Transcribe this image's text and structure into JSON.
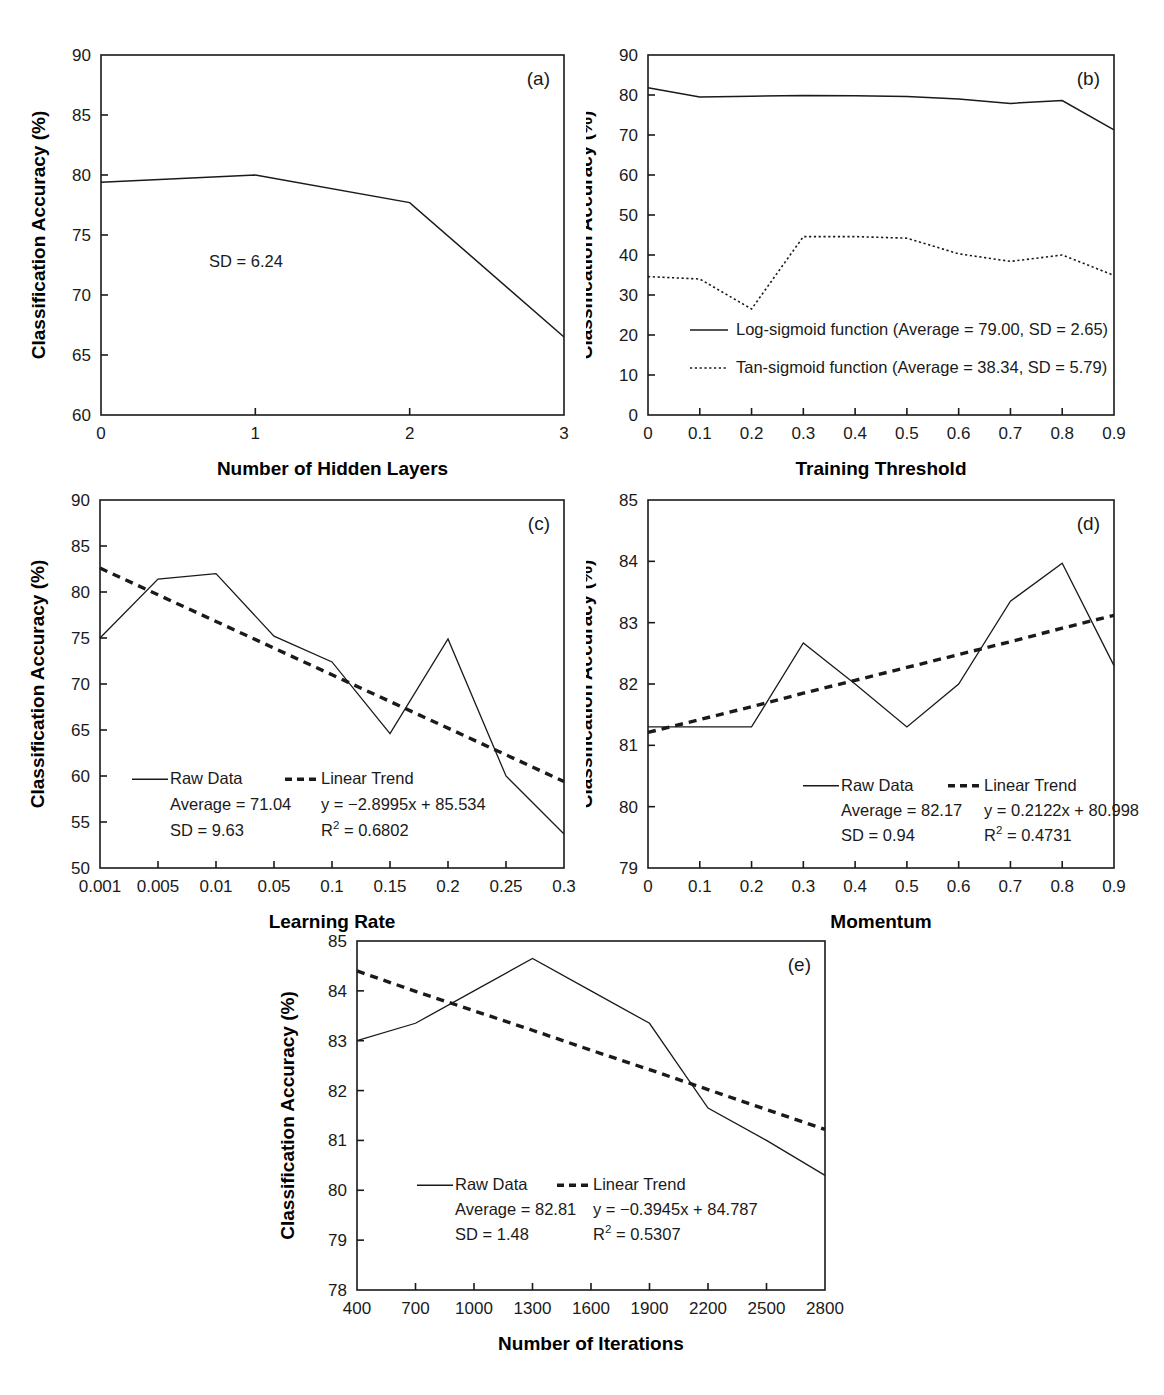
{
  "figure": {
    "y_axis_label": "Classification Accuracy (%)",
    "panel_labels": [
      "(a)",
      "(b)",
      "(c)",
      "(d)",
      "(e)"
    ]
  },
  "chart_data": [
    {
      "id": "a",
      "type": "line",
      "panel_label": "(a)",
      "title": "",
      "xlabel": "Number of Hidden Layers",
      "ylabel": "Classification Accuracy (%)",
      "xlim": [
        0,
        3
      ],
      "ylim": [
        60,
        90
      ],
      "xticks": [
        "0",
        "1",
        "2",
        "3"
      ],
      "yticks": [
        "60",
        "65",
        "70",
        "75",
        "80",
        "85",
        "90"
      ],
      "grid": false,
      "legend": "none",
      "annotations": [
        "SD = 6.24"
      ],
      "series": [
        {
          "name": "Raw Data",
          "style": "solid",
          "x": [
            0,
            1,
            2,
            3
          ],
          "values": [
            79.4,
            80.0,
            77.7,
            66.5
          ]
        }
      ]
    },
    {
      "id": "b",
      "type": "line",
      "panel_label": "(b)",
      "title": "",
      "xlabel": "Training Threshold",
      "ylabel": "Classification Accuracy (%)",
      "xlim": [
        0,
        0.9
      ],
      "ylim": [
        0,
        90
      ],
      "xticks": [
        "0",
        "0.1",
        "0.2",
        "0.3",
        "0.4",
        "0.5",
        "0.6",
        "0.7",
        "0.8",
        "0.9"
      ],
      "yticks": [
        "0",
        "10",
        "20",
        "30",
        "40",
        "50",
        "60",
        "70",
        "80",
        "90"
      ],
      "grid": false,
      "legend": "inside-lower-left",
      "annotations": [],
      "categories": [
        0,
        0.1,
        0.2,
        0.3,
        0.4,
        0.5,
        0.6,
        0.7,
        0.8,
        0.9
      ],
      "series": [
        {
          "name": "Log-sigmoid function (Average = 79.00, SD = 2.65)",
          "style": "solid",
          "values": [
            81.8,
            79.5,
            79.7,
            79.9,
            79.8,
            79.6,
            79.0,
            77.9,
            78.6,
            71.3
          ]
        },
        {
          "name": "Tan-sigmoid function (Average = 38.34, SD = 5.79)",
          "style": "dotted",
          "values": [
            34.6,
            34.0,
            26.5,
            44.6,
            44.6,
            44.2,
            40.3,
            38.4,
            40.0,
            34.9
          ]
        }
      ]
    },
    {
      "id": "c",
      "type": "line",
      "panel_label": "(c)",
      "title": "",
      "xlabel": "Learning Rate",
      "ylabel": "Classification Accuracy (%)",
      "xlim": [
        0,
        8
      ],
      "ylim": [
        50,
        90
      ],
      "xticks": [
        "0.001",
        "0.005",
        "0.01",
        "0.05",
        "0.1",
        "0.15",
        "0.2",
        "0.25",
        "0.3"
      ],
      "yticks": [
        "50",
        "55",
        "60",
        "65",
        "70",
        "75",
        "80",
        "85",
        "90"
      ],
      "grid": false,
      "legend": "inside-lower-left",
      "legend_entries": [
        {
          "label": "Raw Data",
          "style": "solid"
        },
        {
          "label": "Linear Trend",
          "style": "dashed"
        }
      ],
      "annotations": [
        "Average = 71.04",
        "SD = 9.63",
        "y = −2.8995x + 85.534",
        "R² = 0.6802"
      ],
      "trend_equation": {
        "slope": -2.8995,
        "intercept": 85.534,
        "r_squared": 0.6802
      },
      "stats": {
        "average": 71.04,
        "sd": 9.63
      },
      "series": [
        {
          "name": "Raw Data",
          "style": "solid",
          "values": [
            75.0,
            81.4,
            82.0,
            75.2,
            72.4,
            64.6,
            74.9,
            60.0,
            53.7
          ]
        },
        {
          "name": "Linear Trend",
          "style": "dashed",
          "values": [
            82.6,
            79.7,
            76.8,
            73.9,
            71.0,
            68.1,
            65.2,
            62.3,
            59.4
          ]
        }
      ]
    },
    {
      "id": "d",
      "type": "line",
      "panel_label": "(d)",
      "title": "",
      "xlabel": "Momentum",
      "ylabel": "Classification Accuracy (%)",
      "xlim": [
        0,
        0.9
      ],
      "ylim": [
        79,
        85
      ],
      "xticks": [
        "0",
        "0.1",
        "0.2",
        "0.3",
        "0.4",
        "0.5",
        "0.6",
        "0.7",
        "0.8",
        "0.9"
      ],
      "yticks": [
        "79",
        "80",
        "81",
        "82",
        "83",
        "84",
        "85"
      ],
      "grid": false,
      "legend": "inside-lower-center",
      "legend_entries": [
        {
          "label": "Raw Data",
          "style": "solid"
        },
        {
          "label": "Linear Trend",
          "style": "dashed"
        }
      ],
      "annotations": [
        "Average = 82.17",
        "SD = 0.94",
        "y = 0.2122x + 80.998",
        "R² = 0.4731"
      ],
      "trend_equation": {
        "slope": 0.2122,
        "intercept": 80.998,
        "r_squared": 0.4731
      },
      "stats": {
        "average": 82.17,
        "sd": 0.94
      },
      "categories": [
        0,
        0.1,
        0.2,
        0.3,
        0.4,
        0.5,
        0.6,
        0.7,
        0.8,
        0.9
      ],
      "series": [
        {
          "name": "Raw Data",
          "style": "solid",
          "values": [
            81.3,
            81.3,
            81.3,
            82.67,
            82.0,
            81.3,
            82.0,
            83.35,
            83.97,
            82.3
          ]
        },
        {
          "name": "Linear Trend",
          "style": "dashed",
          "values": [
            81.21,
            81.42,
            81.63,
            81.85,
            82.06,
            82.27,
            82.48,
            82.69,
            82.91,
            83.12
          ]
        }
      ]
    },
    {
      "id": "e",
      "type": "line",
      "panel_label": "(e)",
      "title": "",
      "xlabel": "Number of Iterations",
      "ylabel": "Classification Accuracy (%)",
      "xlim": [
        400,
        2800
      ],
      "ylim": [
        78,
        85
      ],
      "xticks": [
        "400",
        "700",
        "1000",
        "1300",
        "1600",
        "1900",
        "2200",
        "2500",
        "2800"
      ],
      "yticks": [
        "78",
        "79",
        "80",
        "81",
        "82",
        "83",
        "84",
        "85"
      ],
      "grid": false,
      "legend": "inside-lower-left",
      "legend_entries": [
        {
          "label": "Raw Data",
          "style": "solid"
        },
        {
          "label": "Linear Trend",
          "style": "dashed"
        }
      ],
      "annotations": [
        "Average = 82.81",
        "SD = 1.48",
        "y = −0.3945x + 84.787",
        "R² = 0.5307"
      ],
      "trend_equation": {
        "slope": -0.3945,
        "intercept": 84.787,
        "r_squared": 0.5307
      },
      "stats": {
        "average": 82.81,
        "sd": 1.48
      },
      "categories": [
        400,
        700,
        1000,
        1300,
        1600,
        1900,
        2200,
        2500,
        2800
      ],
      "series": [
        {
          "name": "Raw Data",
          "style": "solid",
          "values": [
            83.0,
            83.35,
            84.0,
            84.65,
            84.0,
            83.35,
            81.65,
            81.0,
            80.3
          ]
        },
        {
          "name": "Linear Trend",
          "style": "dashed",
          "values": [
            84.4,
            83.99,
            83.6,
            83.21,
            82.81,
            82.42,
            82.02,
            81.62,
            81.22
          ]
        }
      ]
    }
  ]
}
